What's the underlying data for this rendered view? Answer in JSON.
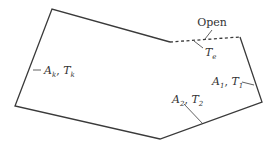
{
  "diagram": {
    "type": "enclosure-surfaces",
    "colors": {
      "stroke": "#3a3a3a",
      "text": "#333333",
      "background": "#ffffff"
    },
    "labels": {
      "open": "Open",
      "surroundings": {
        "var": "T",
        "sub": "e"
      },
      "surface_k": {
        "area": "A",
        "area_sub": "k",
        "temp": "T",
        "temp_sub": "k",
        "sep": ", "
      },
      "surface_1": {
        "area": "A",
        "area_sub": "1",
        "temp": "T",
        "temp_sub": "1",
        "sep": ", "
      },
      "surface_2": {
        "area": "A",
        "area_sub": "2",
        "temp": "T",
        "temp_sub": "2",
        "sep": ", "
      }
    }
  }
}
